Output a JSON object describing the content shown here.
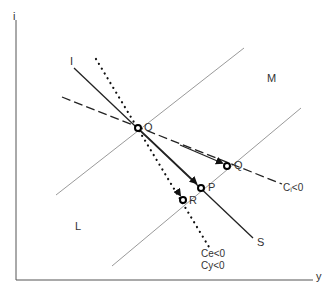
{
  "axes": {
    "y_label": "i",
    "x_label": "y"
  },
  "regions": {
    "upper": "M",
    "lower": "L"
  },
  "lines": {
    "solid": {
      "start_label": "I",
      "end_label": "S"
    },
    "dashed": {
      "label": "Cᵢ<0"
    },
    "dotted": {
      "label_1": "Ce<0",
      "label_2": "Cy<0"
    }
  },
  "points": {
    "O": "O",
    "P": "P",
    "Q": "Q",
    "R": "R"
  },
  "colors": {
    "axis": "#555555",
    "grid_line": "#9a9a9a",
    "main_line": "#222222"
  }
}
